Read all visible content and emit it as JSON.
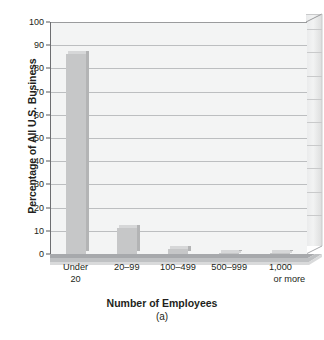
{
  "chart_data": {
    "type": "bar",
    "title": "",
    "subtitle": "(a)",
    "xlabel": "Number of Employees",
    "ylabel": "Percentage of All U.S. Business",
    "categories": [
      "Under 20",
      "20–99",
      "100–499",
      "500–999",
      "1,000 or more"
    ],
    "category_lines": [
      [
        "Under",
        "20"
      ],
      [
        "20–99",
        ""
      ],
      [
        "100–499",
        ""
      ],
      [
        "500–999",
        ""
      ],
      [
        "1,000",
        "or more"
      ]
    ],
    "values": [
      86,
      11,
      2,
      0.6,
      0.5
    ],
    "ylim": [
      0,
      100
    ],
    "yticks": [
      0,
      10,
      20,
      30,
      40,
      50,
      60,
      70,
      80,
      90,
      100
    ],
    "ytick_labels": [
      "0",
      "10",
      "20",
      "30",
      "40",
      "50",
      "60",
      "70",
      "80",
      "90",
      "100"
    ],
    "grid": true,
    "legend": "none",
    "style": "3d-bar",
    "colors": {
      "bar_face": "#c6c7c8",
      "bar_top": "#d6d7d8",
      "bar_side": "#b3b4b5",
      "plot_background": "#f3f4f4",
      "gridline": "#bcbec0",
      "axis": "#6d6e71",
      "floor": "#a7a9ac",
      "text": "#231f20"
    }
  }
}
